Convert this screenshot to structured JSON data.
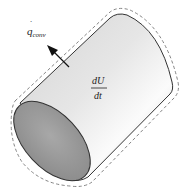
{
  "diagram": {
    "shape": "cylinder",
    "boundary_style": "dashed control surface",
    "labels": {
      "heat_flow": {
        "symbol": "q",
        "dot": "˙",
        "subscript": "conv"
      },
      "energy_rate": {
        "numerator": "dU",
        "denominator": "dt"
      }
    },
    "arrow": {
      "direction": "outward (up-left)",
      "meaning": "convective heat loss"
    },
    "colors": {
      "body_light": "#f4f4f4",
      "body_mid": "#d8d8d8",
      "end_face": "#9a9a9a",
      "outline": "#333333",
      "dashed": "#777777",
      "text": "#222222"
    }
  }
}
